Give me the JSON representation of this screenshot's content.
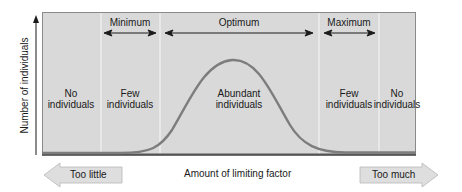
{
  "diagram": {
    "y_axis_label": "Number of individuals",
    "x_axis_label": "Amount of limiting factor",
    "ranges": [
      {
        "label": "Minimum",
        "x1": 104,
        "x2": 156
      },
      {
        "label": "Optimum",
        "x1": 165,
        "x2": 313
      },
      {
        "label": "Maximum",
        "x1": 324,
        "x2": 375
      }
    ],
    "zones": [
      {
        "line1": "No",
        "line2": "individuals",
        "center_x": 71
      },
      {
        "line1": "Few",
        "line2": "individuals",
        "center_x": 130
      },
      {
        "line1": "Abundant",
        "line2": "individuals",
        "center_x": 239
      },
      {
        "line1": "Few",
        "line2": "individuals",
        "center_x": 349
      },
      {
        "line1": "No",
        "line2": "individuals",
        "center_x": 397
      }
    ],
    "bottom_arrows": {
      "left": "Too little",
      "right": "Too much"
    },
    "colors": {
      "panel_fill": "#d9d9d9",
      "panel_border": "#7a7a7a",
      "divider": "#ececec",
      "curve": "#7d7d7d",
      "baseline": "#555555",
      "arrow_fill": "#dedede",
      "arrow_edge": "#b8b8b8",
      "text": "#1a1a1a"
    }
  }
}
